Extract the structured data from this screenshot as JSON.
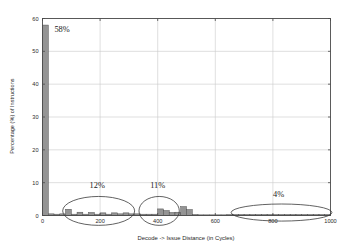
{
  "chart_data": {
    "type": "bar",
    "title": "",
    "subtitle": "",
    "xlabel": "Decode -> Issue Distance (in Cycles)",
    "ylabel": "Percentage (%) of Instructions",
    "xlim": [
      0,
      1000
    ],
    "ylim": [
      0,
      60
    ],
    "grid": true,
    "legend": "none",
    "x_ticks": [
      0,
      200,
      400,
      600,
      800,
      1000
    ],
    "x_tick_labels": [
      "0",
      "200",
      "400",
      "600",
      "800",
      "1000"
    ],
    "y_ticks": [
      0,
      10,
      20,
      30,
      40,
      50,
      60
    ],
    "y_tick_labels": [
      "0",
      "10",
      "20",
      "30",
      "40",
      "50",
      "60"
    ],
    "bar_width": 20,
    "x": [
      10,
      30,
      50,
      70,
      90,
      110,
      130,
      150,
      170,
      190,
      210,
      230,
      250,
      270,
      290,
      310,
      330,
      350,
      370,
      390,
      410,
      430,
      450,
      470,
      490,
      510,
      530,
      550,
      570,
      590,
      610,
      630,
      650,
      670,
      690,
      710,
      730,
      750,
      770,
      790,
      810,
      830,
      850,
      870,
      890,
      910,
      930,
      950,
      970,
      990
    ],
    "values": [
      58,
      0.5,
      0.4,
      0.5,
      1.9,
      0.4,
      1.0,
      0.4,
      0.9,
      0.4,
      0.8,
      0.4,
      0.8,
      0.5,
      0.8,
      0.5,
      0.5,
      0.4,
      0.4,
      0.4,
      2.0,
      1.5,
      0.9,
      1.0,
      2.7,
      1.8,
      0.3,
      0.2,
      0.2,
      0.2,
      0.2,
      0.2,
      0.3,
      0.3,
      0.3,
      0.3,
      0.3,
      0.3,
      0.3,
      0.3,
      0.3,
      0.3,
      0.3,
      0.3,
      0.3,
      0.3,
      0.3,
      0.3,
      0.3,
      0.3
    ],
    "annotations": [
      {
        "label": "58%",
        "kind": "bar-label",
        "x": 10,
        "y": 58
      },
      {
        "label": "12%",
        "kind": "group-label",
        "x": 190,
        "y": 8.5
      },
      {
        "label": "11%",
        "kind": "group-label",
        "x": 400,
        "y": 8.5
      },
      {
        "label": "4%",
        "kind": "group-label",
        "x": 820,
        "y": 5.5
      }
    ],
    "ellipses": [
      {
        "label": "12% group",
        "cx": 195,
        "cy": 1.4,
        "rx": 125,
        "ry": 4.4
      },
      {
        "label": "11% group",
        "cx": 405,
        "cy": 1.4,
        "rx": 70,
        "ry": 4.4
      },
      {
        "label": "4% group",
        "cx": 830,
        "cy": 0.9,
        "rx": 175,
        "ry": 2.6
      }
    ],
    "colors": {
      "bar_fill": "#949494",
      "bar_stroke": "#4f4f4f",
      "grid": "#c9c9c9",
      "axis": "#4a4a4a",
      "text": "#1f1f1f",
      "annotation": "#3a3a3a"
    }
  }
}
